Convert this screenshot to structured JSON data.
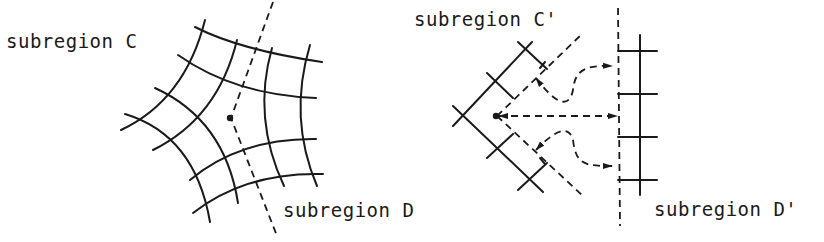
{
  "figure": {
    "left_panel": {
      "label_upper": "subregion C",
      "label_lower": "subregion D",
      "description": "curvilinear mesh around a singular point split by a dashed boundary"
    },
    "right_panel": {
      "label_upper": "subregion C'",
      "label_lower": "subregion D'",
      "description": "mapped subregions with dashed connection arrows"
    }
  },
  "colors": {
    "ink": "#1a1a1a",
    "background": "#ffffff"
  }
}
